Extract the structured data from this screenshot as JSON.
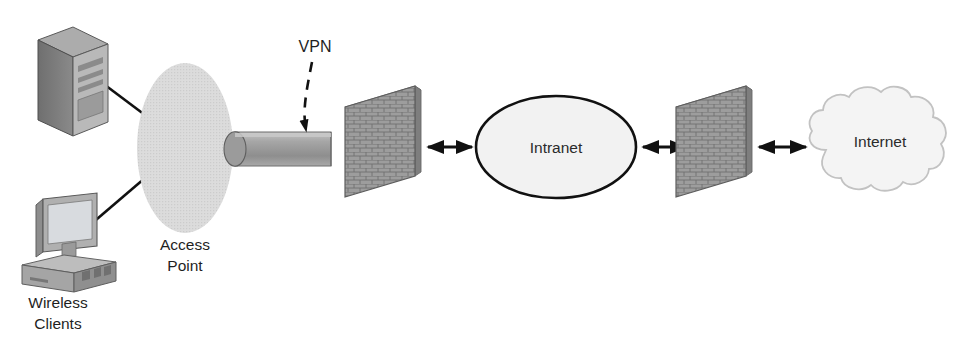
{
  "diagram": {
    "background_color": "#ffffff",
    "nodes": {
      "server": {
        "label": "",
        "icon": "server-tower-icon",
        "type": "device"
      },
      "workstation": {
        "label": "",
        "icon": "desktop-computer-icon",
        "type": "device"
      },
      "wireless_clients_caption": {
        "line1": "Wireless",
        "line2": "Clients"
      },
      "access_point": {
        "caption_line1": "Access",
        "caption_line2": "Point",
        "icon": "access-point-ellipse-icon",
        "fill_color": "#d9d9d9"
      },
      "vpn_tunnel": {
        "label": "VPN",
        "icon": "vpn-tunnel-cylinder-icon",
        "fill_color": "#a0a0a0"
      },
      "firewall_inner": {
        "label": "",
        "icon": "brick-wall-firewall-icon",
        "fill_color": "#9a9a9a"
      },
      "intranet": {
        "label": "Intranet",
        "icon": "intranet-ellipse-icon",
        "fill_color": "#f2f2f2",
        "stroke_color": "#111111"
      },
      "firewall_outer": {
        "label": "",
        "icon": "brick-wall-firewall-icon",
        "fill_color": "#9a9a9a"
      },
      "internet": {
        "label": "Internet",
        "icon": "internet-cloud-icon",
        "fill_color": "#f4f4f4",
        "stroke_color": "#c6c6c6"
      }
    },
    "connectors": [
      {
        "name": "server-to-access-point",
        "style": "solid-line",
        "arrows": "none"
      },
      {
        "name": "workstation-to-access-point",
        "style": "solid-line",
        "arrows": "none"
      },
      {
        "name": "vpn-callout-to-tunnel",
        "style": "dashed-curve",
        "arrows": "end"
      },
      {
        "name": "firewall-inner-to-intranet",
        "style": "solid-line",
        "arrows": "both"
      },
      {
        "name": "intranet-to-firewall-outer",
        "style": "solid-line",
        "arrows": "both"
      },
      {
        "name": "firewall-outer-to-internet",
        "style": "solid-line",
        "arrows": "both"
      }
    ],
    "colors": {
      "line": "#111111",
      "text": "#1f1f1f",
      "server_body": "#7d7d7d",
      "server_front": "#b4b4b4",
      "monitor_screen": "#d5d8dc",
      "brick": "#9a9a9a",
      "brick_mortar": "#6f6f6f"
    }
  }
}
